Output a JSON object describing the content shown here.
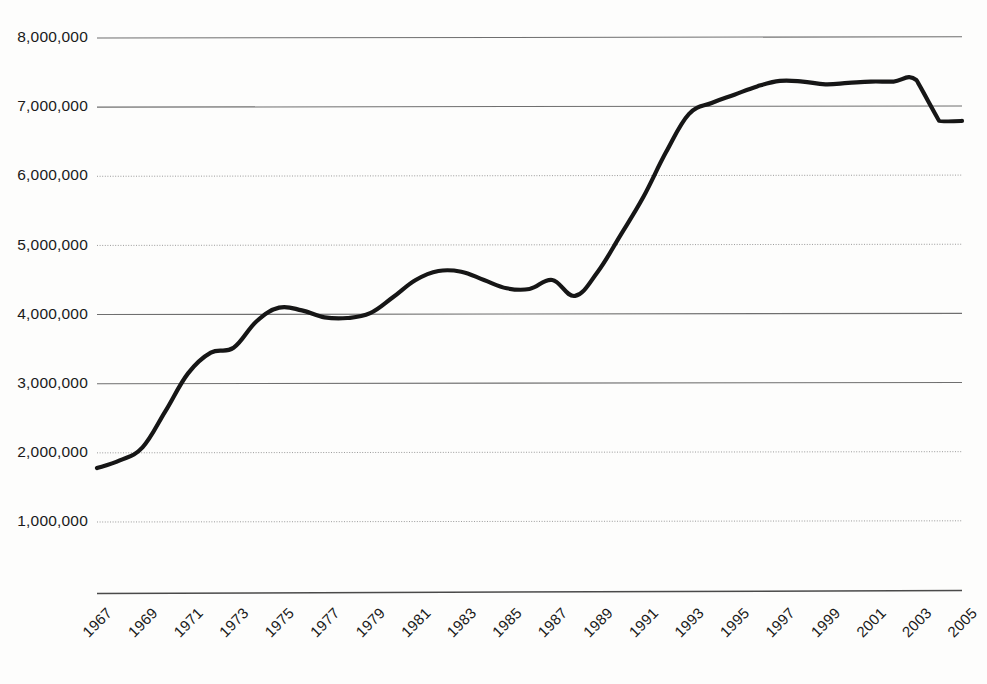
{
  "chart_data": {
    "type": "line",
    "title": "",
    "subtitle": "",
    "xlabel": "",
    "ylabel": "",
    "grid": true,
    "legend": "none",
    "xlim": [
      1967,
      2005
    ],
    "ylim": [
      0,
      8000000
    ],
    "y_ticks": [
      1000000,
      2000000,
      3000000,
      4000000,
      5000000,
      6000000,
      7000000,
      8000000
    ],
    "y_tick_labels": [
      "1,000,000",
      "2,000,000",
      "3,000,000",
      "4,000,000",
      "5,000,000",
      "6,000,000",
      "7,000,000",
      "8,000,000"
    ],
    "x_tick_labels": [
      "1967",
      "1969",
      "1971",
      "1973",
      "1975",
      "1977",
      "1979",
      "1981",
      "1983",
      "1985",
      "1987",
      "1989",
      "1991",
      "1993",
      "1995",
      "1997",
      "1999",
      "2001",
      "2003",
      "2005"
    ],
    "x_tick_rotation_deg": 45,
    "series": [
      {
        "name": "series-1",
        "color": "#161616",
        "x": [
          1967,
          1968,
          1969,
          1970,
          1971,
          1972,
          1973,
          1974,
          1975,
          1976,
          1977,
          1978,
          1979,
          1980,
          1981,
          1982,
          1983,
          1984,
          1985,
          1986,
          1987,
          1988,
          1989,
          1990,
          1991,
          1992,
          1993,
          1994,
          1995,
          1996,
          1997,
          1998,
          1999,
          2000,
          2001,
          2002,
          2003,
          2004,
          2005
        ],
        "values": [
          1780000,
          1890000,
          2080000,
          2600000,
          3150000,
          3450000,
          3520000,
          3900000,
          4100000,
          4060000,
          3960000,
          3950000,
          4020000,
          4250000,
          4500000,
          4630000,
          4620000,
          4500000,
          4380000,
          4370000,
          4500000,
          4270000,
          4620000,
          5150000,
          5700000,
          6350000,
          6900000,
          7060000,
          7180000,
          7300000,
          7380000,
          7370000,
          7330000,
          7350000,
          7370000,
          7370000,
          7390000,
          6800000,
          6800000
        ]
      }
    ]
  },
  "layout": {
    "plot_left": 97,
    "plot_right": 962,
    "y_pixel_8m": 38,
    "y_pixel_1m": 522,
    "axis_baseline_y": 592,
    "gridline_solid_values": [
      8000000,
      7000000,
      4000000,
      3000000
    ],
    "gridline_dotted_values": [
      6000000,
      5000000,
      2000000,
      1000000
    ]
  },
  "colors": {
    "background": "#fdfdfc",
    "line": "#161616",
    "gridline_solid": "#6f6f6f",
    "gridline_dotted": "#9a9a9a",
    "axis": "#4a4a4a",
    "text": "#1a1a1a"
  }
}
